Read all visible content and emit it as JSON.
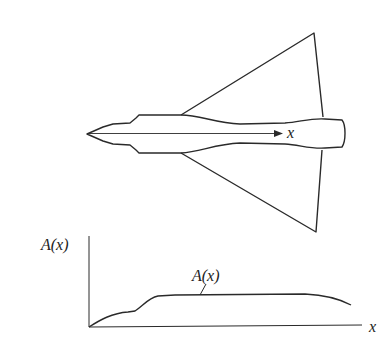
{
  "figure": {
    "aircraft_axis_label": "x",
    "plot_y_label": "A(x)",
    "plot_x_label": "x",
    "curve_label": "A(x)"
  },
  "colors": {
    "ink": "#2a2a2a",
    "background": "#ffffff"
  }
}
